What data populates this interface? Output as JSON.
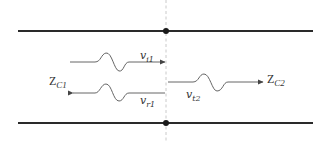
{
  "diagram": {
    "title": "",
    "type": "transmission-line-wave-reflection",
    "colors": {
      "conductor": "#2a2a2a",
      "wave": "#555555",
      "boundary": "#bbbbbb",
      "text": "#333333"
    },
    "regions": [
      {
        "id": "line1",
        "impedance_main": "Z",
        "impedance_sub": "C1"
      },
      {
        "id": "line2",
        "impedance_main": "Z",
        "impedance_sub": "C2"
      }
    ],
    "waves": [
      {
        "id": "incident",
        "label_main": "v",
        "label_sub": "i1",
        "direction": "right"
      },
      {
        "id": "reflected",
        "label_main": "v",
        "label_sub": "r1",
        "direction": "left"
      },
      {
        "id": "transmitted",
        "label_main": "v",
        "label_sub": "t2",
        "direction": "right"
      }
    ],
    "junction": {
      "description": "discontinuity boundary (dashed vertical line) with junction dots on both conductors"
    }
  }
}
